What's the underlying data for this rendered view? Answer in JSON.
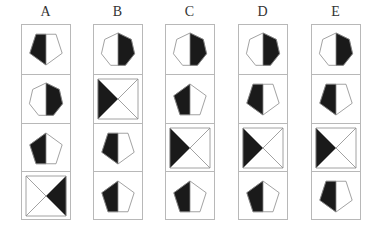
{
  "puzzle": {
    "fill_color": "#1a1a1a",
    "stroke_color": "#8a8a8a",
    "columns": [
      {
        "label": "A",
        "cells": [
          {
            "shape": "pentagon-down",
            "black_side": "left"
          },
          {
            "shape": "heptagon",
            "black_side": "right"
          },
          {
            "shape": "pentagon-up",
            "black_side": "left"
          },
          {
            "shape": "x-square",
            "black_side": "right"
          }
        ]
      },
      {
        "label": "B",
        "cells": [
          {
            "shape": "heptagon",
            "black_side": "right"
          },
          {
            "shape": "x-square",
            "black_side": "left"
          },
          {
            "shape": "pentagon-down",
            "black_side": "left"
          },
          {
            "shape": "pentagon-up",
            "black_side": "left"
          }
        ]
      },
      {
        "label": "C",
        "cells": [
          {
            "shape": "heptagon",
            "black_side": "right"
          },
          {
            "shape": "pentagon-up",
            "black_side": "left"
          },
          {
            "shape": "x-square",
            "black_side": "left"
          },
          {
            "shape": "pentagon-up",
            "black_side": "left"
          }
        ]
      },
      {
        "label": "D",
        "cells": [
          {
            "shape": "heptagon",
            "black_side": "right"
          },
          {
            "shape": "pentagon-down",
            "black_side": "left"
          },
          {
            "shape": "x-square",
            "black_side": "left"
          },
          {
            "shape": "pentagon-up",
            "black_side": "left"
          }
        ]
      },
      {
        "label": "E",
        "cells": [
          {
            "shape": "heptagon",
            "black_side": "right"
          },
          {
            "shape": "pentagon-down",
            "black_side": "left"
          },
          {
            "shape": "x-square",
            "black_side": "left"
          },
          {
            "shape": "pentagon-down",
            "black_side": "left"
          }
        ]
      }
    ]
  }
}
